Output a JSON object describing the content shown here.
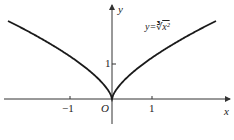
{
  "figure": {
    "function_label": "y=∛(x²)",
    "function_label_prefix": "y=",
    "function_label_radical": "∛",
    "function_label_radicand": "x²",
    "x_axis_label": "x",
    "y_axis_label": "y",
    "origin_label": "O",
    "x_ticks": [
      "−1",
      "1"
    ],
    "y_ticks": [
      "1"
    ],
    "curve_color": "#1a1a1a",
    "axis_color": "#333333"
  }
}
